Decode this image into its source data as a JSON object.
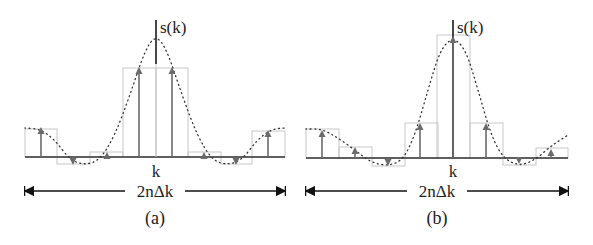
{
  "panels": [
    {
      "id": "a",
      "caption": "(a)",
      "axis_label_y": "s(k)",
      "axis_label_x": "k",
      "span_label": "2nΔk",
      "axis_x": 156,
      "baseline_y": 157,
      "axis_top_y": 20,
      "left_x": 25,
      "right_x": 285,
      "cell_width": 32.5,
      "samples": [
        {
          "x": 41,
          "y": 128,
          "rect": [
            25,
            129,
            32,
            28
          ]
        },
        {
          "x": 73,
          "y": 164,
          "rect": [
            57,
            157,
            33,
            7
          ]
        },
        {
          "x": 107,
          "y": 153,
          "rect": [
            90,
            152,
            33,
            5
          ]
        },
        {
          "x": 139,
          "y": 68,
          "rect": [
            123,
            68,
            33,
            89
          ]
        },
        {
          "x": 172,
          "y": 68,
          "rect": [
            156,
            68,
            32,
            89
          ]
        },
        {
          "x": 204,
          "y": 153,
          "rect": [
            188,
            152,
            33,
            5
          ]
        },
        {
          "x": 236,
          "y": 164,
          "rect": [
            221,
            157,
            31,
            7
          ]
        },
        {
          "x": 268,
          "y": 131,
          "rect": [
            252,
            131,
            33,
            26
          ]
        }
      ],
      "center_spike_y": 64,
      "curve_points": [
        [
          25,
          128
        ],
        [
          40,
          129
        ],
        [
          55,
          140
        ],
        [
          70,
          160
        ],
        [
          85,
          165
        ],
        [
          100,
          160
        ],
        [
          115,
          135
        ],
        [
          130,
          95
        ],
        [
          145,
          50
        ],
        [
          156,
          35
        ],
        [
          167,
          50
        ],
        [
          182,
          95
        ],
        [
          197,
          135
        ],
        [
          212,
          160
        ],
        [
          227,
          165
        ],
        [
          242,
          160
        ],
        [
          257,
          140
        ],
        [
          272,
          129
        ],
        [
          285,
          128
        ]
      ]
    },
    {
      "id": "b",
      "caption": "(b)",
      "axis_label_y": "s(k)",
      "axis_label_x": "k",
      "span_label": "2nΔk",
      "axis_x": 453,
      "baseline_y": 158,
      "axis_top_y": 20,
      "left_x": 306,
      "right_x": 568,
      "samples": [
        {
          "x": 322,
          "y": 131,
          "rect": [
            306,
            129,
            33,
            29
          ]
        },
        {
          "x": 355,
          "y": 148,
          "rect": [
            339,
            147,
            33,
            11
          ]
        },
        {
          "x": 388,
          "y": 165,
          "rect": [
            372,
            158,
            33,
            8
          ]
        },
        {
          "x": 420,
          "y": 124,
          "rect": [
            405,
            123,
            33,
            35
          ]
        },
        {
          "x": 453,
          "y": 37,
          "rect": [
            437,
            35,
            33,
            123
          ]
        },
        {
          "x": 486,
          "y": 124,
          "rect": [
            470,
            123,
            33,
            35
          ]
        },
        {
          "x": 519,
          "y": 163,
          "rect": [
            503,
            158,
            33,
            7
          ]
        },
        {
          "x": 551,
          "y": 150,
          "rect": [
            536,
            148,
            32,
            10
          ]
        }
      ],
      "curve_points": [
        [
          306,
          129
        ],
        [
          322,
          129
        ],
        [
          338,
          138
        ],
        [
          355,
          150
        ],
        [
          370,
          162
        ],
        [
          388,
          166
        ],
        [
          403,
          160
        ],
        [
          415,
          135
        ],
        [
          428,
          90
        ],
        [
          440,
          50
        ],
        [
          453,
          37
        ],
        [
          466,
          50
        ],
        [
          478,
          90
        ],
        [
          491,
          135
        ],
        [
          503,
          158
        ],
        [
          519,
          166
        ],
        [
          535,
          160
        ],
        [
          551,
          146
        ],
        [
          568,
          135
        ]
      ]
    }
  ],
  "colors": {
    "axis": "#333333",
    "stem": "#6b6b6b",
    "rect": "#c8c8c8",
    "curve": "#333333",
    "text": "#222222"
  }
}
